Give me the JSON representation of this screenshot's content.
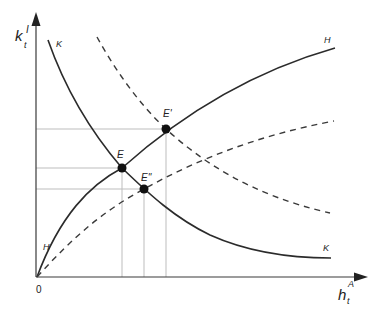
{
  "axes": {
    "y_label": "k",
    "y_label_sup": "I",
    "y_label_sub": "t",
    "x_label": "h",
    "x_label_sup": "A",
    "x_label_sub": "t",
    "origin_label": "0"
  },
  "curves": {
    "H": {
      "label": "H",
      "style": "solid"
    },
    "K": {
      "label": "K",
      "style": "solid"
    },
    "H_shifted": {
      "label": "",
      "style": "dashed"
    },
    "K_shifted": {
      "label": "",
      "style": "dashed"
    }
  },
  "points": {
    "E": {
      "label": "E"
    },
    "E_prime": {
      "label": "E'"
    },
    "E_double_prime": {
      "label": "E''"
    }
  },
  "labels": {
    "H_top": "H",
    "H_bottom": "H",
    "K_top": "K",
    "K_bottom": "K"
  }
}
